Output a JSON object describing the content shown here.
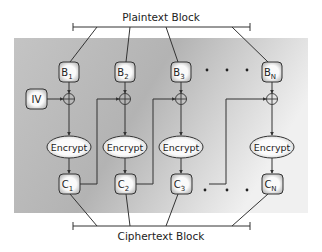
{
  "diagram": {
    "title_top": "Plaintext Block",
    "title_bottom": "Ciphertext Block",
    "iv_label": "IV",
    "encrypt_label": "Encrypt",
    "plaintext_blocks": [
      {
        "base": "B",
        "sub": "1"
      },
      {
        "base": "B",
        "sub": "2"
      },
      {
        "base": "B",
        "sub": "3"
      },
      {
        "base": "B",
        "sub": "N"
      }
    ],
    "ciphertext_blocks": [
      {
        "base": "C",
        "sub": "1"
      },
      {
        "base": "C",
        "sub": "2"
      },
      {
        "base": "C",
        "sub": "3"
      },
      {
        "base": "C",
        "sub": "N"
      }
    ],
    "ellipsis": "· · ·",
    "operator": "xor",
    "colors": {
      "panel_dark": "#a9a9a9",
      "panel_light": "#f2f2f2",
      "box_fill": "#f4f4f4",
      "line": "#333333"
    }
  }
}
